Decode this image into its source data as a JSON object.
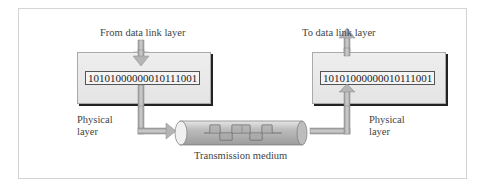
{
  "diagram": {
    "left": {
      "top_label": "From data link layer",
      "bits": "10101000000010111001",
      "side_label_line1": "Physical",
      "side_label_line2": "layer"
    },
    "right": {
      "top_label": "To data link layer",
      "bits": "10101000000010111001",
      "side_label_line1": "Physical",
      "side_label_line2": "layer"
    },
    "medium": {
      "label": "Transmission medium"
    },
    "colors": {
      "arrow": "#b0b0b0",
      "box": "#e8e8e8",
      "pipe": "#cfcfcf",
      "shadow": "#222222"
    }
  }
}
